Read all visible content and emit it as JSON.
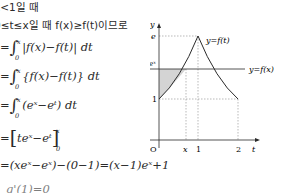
{
  "document": {
    "lines": [
      {
        "id": "case",
        "text": "x<1일 때"
      },
      {
        "id": "condition",
        "text": "0≤t≤x일 때 f(x)≥f(t)이므로"
      },
      {
        "id": "step1",
        "prefix": "=",
        "integrand": "|f(x)−f(t)| dt",
        "lower": "0",
        "upper": "x"
      },
      {
        "id": "step2",
        "prefix": "=",
        "integrand": "{f(x)−f(t)} dt",
        "lower": "0",
        "upper": "x"
      },
      {
        "id": "step3",
        "prefix": "=",
        "integrand": "(eˣ−eᵗ) dt",
        "lower": "0",
        "upper": "x"
      },
      {
        "id": "step4",
        "prefix": "=",
        "antiderivative": "teˣ−eᵗ",
        "lower": "0",
        "upper": "x"
      },
      {
        "id": "step5",
        "text": "=(xeˣ−eˣ)−(0−1)=(x−1)eˣ+1"
      },
      {
        "id": "step6_partial",
        "text": "g'(1)=0"
      }
    ]
  },
  "graph": {
    "axis_labels": {
      "y": "y",
      "t": "t",
      "origin": "O"
    },
    "y_ticks": [
      "e",
      "eˣ",
      "1"
    ],
    "x_ticks": [
      "x",
      "1",
      "2"
    ],
    "curve_labels": {
      "f_t": "y=f(t)",
      "f_x": "y=f(x)"
    },
    "shaded_region": "area between y=f(x) and y=f(t) for 0≤t≤x",
    "colors": {
      "curve": "#2a2a2a",
      "shade": "#d4d4d4",
      "dashed": "#8a8a8a"
    }
  }
}
